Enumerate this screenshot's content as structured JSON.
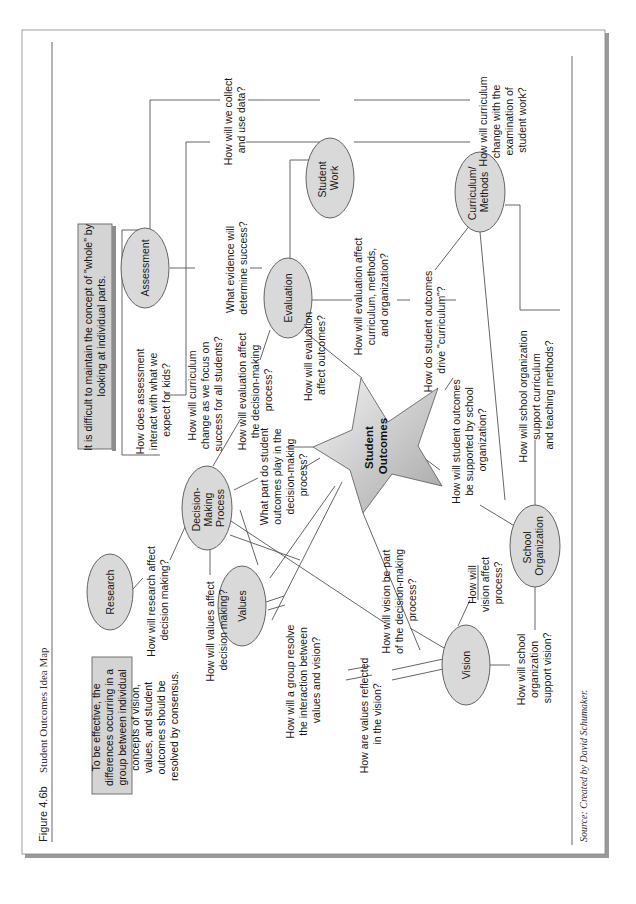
{
  "figure": {
    "number": "Figure 4.6b",
    "title": "Student Outcomes Idea Map",
    "source": "Source: Created by David Schumaker."
  },
  "callouts": {
    "top_box": [
      "It is difficult to maintain the concept of \"whole\" by",
      "looking at individual parts."
    ],
    "left_box": [
      "To be effective, the",
      "differences occurring in a",
      "group between individual",
      "concepts of vision,",
      "values, and student",
      "outcomes should be",
      "resolved by consensus."
    ]
  },
  "nodes": {
    "center": [
      "Student",
      "Outcomes"
    ],
    "research": [
      "Research"
    ],
    "decision_making": [
      "Decision-",
      "Making",
      "Process"
    ],
    "assessment": [
      "Assessment"
    ],
    "evaluation": [
      "Evaluation"
    ],
    "student_work": [
      "Student",
      "Work"
    ],
    "curriculum_methods": [
      "Curriculum/",
      "Methods"
    ],
    "values": [
      "Values"
    ],
    "vision": [
      "Vision"
    ],
    "school_organization": [
      "School",
      "Organization"
    ]
  },
  "questions": {
    "research_decision": [
      "How will research affect",
      "decision making?"
    ],
    "values_decision": [
      "How will values affect",
      "decision making?"
    ],
    "assessment_expect": [
      "How does assessment",
      "interact with what we",
      "expect for kids?"
    ],
    "curriculum_focus": [
      "How will curriculum",
      "change as we focus on",
      "success for all students?"
    ],
    "evaluation_decision": [
      "How will evaluation affect",
      "the decision-making",
      "process?"
    ],
    "evidence_success": [
      "What evidence will",
      "determine success?"
    ],
    "collect_data": [
      "How will we collect",
      "and use data?"
    ],
    "outcomes_part": [
      "What part do student",
      "outcomes play in the",
      "decision-making",
      "process?"
    ],
    "evaluation_outcomes": [
      "How will evaluation",
      "affect outcomes?"
    ],
    "evaluation_curriculum": [
      "How will evaluation affect",
      "curriculum, methods,",
      "and organization?"
    ],
    "curriculum_student_work": [
      "How will curriculum",
      "change with the",
      "examination of",
      "student work?"
    ],
    "outcomes_drive": [
      "How do student outcomes",
      "drive \"curriculum\"?"
    ],
    "outcomes_supported": [
      "How will student outcomes",
      "be supported by school",
      "organization?"
    ],
    "school_org_curriculum": [
      "How will school organization",
      "support curriculum",
      "and teaching methods?"
    ],
    "vision_process": [
      "How will",
      "vision affect",
      "process?"
    ],
    "vision_decision": [
      "How will vision be part",
      "of the decision-making",
      "process?"
    ],
    "group_resolve": [
      "How will a group resolve",
      "the interaction between",
      "values and vision?"
    ],
    "values_reflected": [
      "How are values reflected",
      "in the vision?"
    ],
    "school_org_vision": [
      "How will school",
      "organization",
      "support vision?"
    ]
  },
  "colors": {
    "node_fill": "#d9d9d9",
    "box_fill": "#d4d4d4",
    "line": "#555555",
    "star_light": "#f2f2f2",
    "star_dark": "#a8a8a8"
  }
}
